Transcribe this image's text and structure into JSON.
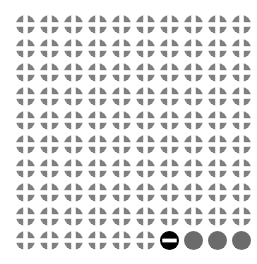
{
  "grid": {
    "name": "icon-grid",
    "columns": 10,
    "rows": 10,
    "total_icons": 100,
    "background_color": "#ffffff"
  },
  "icon_types": {
    "plus_circle": {
      "semantic_name": "plus-circle-icon",
      "fill_color": "#808080",
      "glyph_color": "#ffffff",
      "description": "gray filled circle with white plus cross cutout",
      "count": 96
    },
    "minus_circle": {
      "semantic_name": "minus-circle-icon",
      "fill_color": "#000000",
      "glyph_color": "#ffffff",
      "description": "black filled circle with white horizontal minus bar",
      "count": 1
    },
    "plain_circle": {
      "semantic_name": "plain-circle-icon",
      "fill_color": "#6b6b6b",
      "glyph_color": "",
      "description": "solid dark gray filled circle with no glyph",
      "count": 3
    }
  },
  "chart_data": {
    "type": "heatmap",
    "title": "",
    "xlabel": "",
    "ylabel": "",
    "categories": [
      "1",
      "2",
      "3",
      "4",
      "5",
      "6",
      "7",
      "8",
      "9",
      "10"
    ],
    "rows": [
      [
        "plus_circle",
        "plus_circle",
        "plus_circle",
        "plus_circle",
        "plus_circle",
        "plus_circle",
        "plus_circle",
        "plus_circle",
        "plus_circle",
        "plus_circle"
      ],
      [
        "plus_circle",
        "plus_circle",
        "plus_circle",
        "plus_circle",
        "plus_circle",
        "plus_circle",
        "plus_circle",
        "plus_circle",
        "plus_circle",
        "plus_circle"
      ],
      [
        "plus_circle",
        "plus_circle",
        "plus_circle",
        "plus_circle",
        "plus_circle",
        "plus_circle",
        "plus_circle",
        "plus_circle",
        "plus_circle",
        "plus_circle"
      ],
      [
        "plus_circle",
        "plus_circle",
        "plus_circle",
        "plus_circle",
        "plus_circle",
        "plus_circle",
        "plus_circle",
        "plus_circle",
        "plus_circle",
        "plus_circle"
      ],
      [
        "plus_circle",
        "plus_circle",
        "plus_circle",
        "plus_circle",
        "plus_circle",
        "plus_circle",
        "plus_circle",
        "plus_circle",
        "plus_circle",
        "plus_circle"
      ],
      [
        "plus_circle",
        "plus_circle",
        "plus_circle",
        "plus_circle",
        "plus_circle",
        "plus_circle",
        "plus_circle",
        "plus_circle",
        "plus_circle",
        "plus_circle"
      ],
      [
        "plus_circle",
        "plus_circle",
        "plus_circle",
        "plus_circle",
        "plus_circle",
        "plus_circle",
        "plus_circle",
        "plus_circle",
        "plus_circle",
        "plus_circle"
      ],
      [
        "plus_circle",
        "plus_circle",
        "plus_circle",
        "plus_circle",
        "plus_circle",
        "plus_circle",
        "plus_circle",
        "plus_circle",
        "plus_circle",
        "plus_circle"
      ],
      [
        "plus_circle",
        "plus_circle",
        "plus_circle",
        "plus_circle",
        "plus_circle",
        "plus_circle",
        "plus_circle",
        "plus_circle",
        "plus_circle",
        "plus_circle"
      ],
      [
        "plus_circle",
        "plus_circle",
        "plus_circle",
        "plus_circle",
        "plus_circle",
        "plus_circle",
        "minus_circle",
        "plain_circle",
        "plain_circle",
        "plain_circle"
      ]
    ]
  }
}
